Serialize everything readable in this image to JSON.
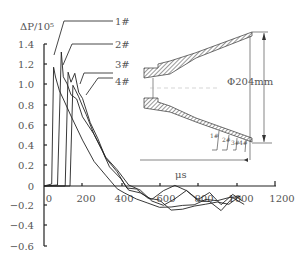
{
  "chart_data": {
    "type": "line",
    "title": "",
    "ylabel": "ΔP/10⁵",
    "xlabel": "μs",
    "ylim": [
      -0.6,
      1.4
    ],
    "xlim": [
      0,
      1200
    ],
    "yticks": [
      "1.4",
      "1.2",
      "1.0",
      "0.8",
      "0.6",
      "0.4",
      "0.2",
      "0",
      "−0.2",
      "−0.4",
      "−0.6"
    ],
    "xticks": [
      "0",
      "200",
      "400",
      "600",
      "800",
      "1000",
      "1200"
    ],
    "legend": [
      "1#",
      "2#",
      "3#",
      "4#"
    ],
    "grid": false,
    "series": [
      {
        "name": "1#",
        "x": [
          0,
          40,
          50,
          60,
          80,
          100,
          140,
          200,
          260,
          320,
          380,
          420,
          480,
          540,
          600,
          660,
          720,
          780,
          840,
          900,
          960,
          1020
        ],
        "y": [
          0,
          0.02,
          1.18,
          1.08,
          0.95,
          0.86,
          0.7,
          0.45,
          0.25,
          0.1,
          -0.02,
          -0.08,
          -0.12,
          -0.18,
          -0.2,
          -0.22,
          -0.18,
          -0.2,
          -0.12,
          -0.16,
          -0.1,
          -0.12
        ]
      },
      {
        "name": "2#",
        "x": [
          0,
          70,
          90,
          100,
          120,
          140,
          170,
          200,
          260,
          320,
          380,
          440,
          500,
          560,
          620,
          680,
          740,
          800,
          860,
          920,
          980,
          1040
        ],
        "y": [
          0,
          0.01,
          1.33,
          1.1,
          1.0,
          0.92,
          0.85,
          0.7,
          0.5,
          0.3,
          0.15,
          0.02,
          -0.05,
          -0.14,
          -0.2,
          -0.12,
          -0.05,
          -0.14,
          -0.16,
          -0.24,
          -0.12,
          -0.18
        ]
      },
      {
        "name": "3#",
        "x": [
          0,
          110,
          125,
          140,
          160,
          180,
          200,
          240,
          280,
          320,
          380,
          430,
          480,
          540,
          600,
          660,
          720,
          780,
          840,
          900,
          960,
          1020
        ],
        "y": [
          0,
          0.0,
          1.13,
          1.05,
          1.1,
          0.95,
          0.85,
          0.65,
          0.45,
          0.3,
          0.12,
          0.0,
          -0.05,
          -0.1,
          -0.16,
          -0.22,
          -0.25,
          -0.18,
          -0.2,
          -0.14,
          -0.2,
          -0.08
        ]
      },
      {
        "name": "4#",
        "x": [
          0,
          135,
          150,
          165,
          180,
          200,
          220,
          260,
          300,
          340,
          400,
          440,
          500,
          560,
          620,
          680,
          740,
          800,
          860,
          920,
          980,
          1030
        ],
        "y": [
          0,
          0.0,
          1.0,
          0.95,
          0.88,
          0.8,
          0.7,
          0.52,
          0.35,
          0.2,
          0.06,
          -0.03,
          -0.08,
          -0.12,
          -0.06,
          0.02,
          -0.06,
          -0.12,
          -0.08,
          -0.17,
          -0.1,
          -0.13
        ]
      }
    ],
    "annotations": {
      "diameter_label": "Φ204mm",
      "sensor_labels": [
        "1#",
        "2#",
        "3#",
        "4#"
      ],
      "inset": "conical expansion nozzle cross-section with sensors 1#–4#"
    }
  }
}
